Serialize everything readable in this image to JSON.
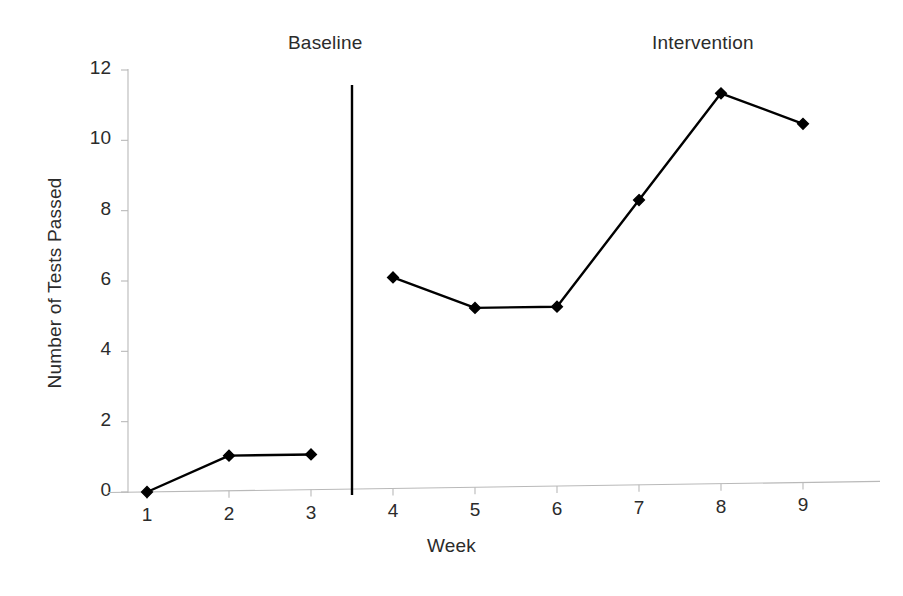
{
  "chart_data": {
    "type": "line",
    "title": "",
    "subtitle": "",
    "xlabel": "Week",
    "ylabel": "Number of Tests Passed",
    "x": [
      1,
      2,
      3,
      4,
      5,
      6,
      7,
      8,
      9
    ],
    "categories": [
      "1",
      "2",
      "3",
      "4",
      "5",
      "6",
      "7",
      "8",
      "9"
    ],
    "values": [
      0,
      1,
      1,
      6,
      5.1,
      5.1,
      8.1,
      11.1,
      10.2
    ],
    "series": [
      {
        "name": "Number of Tests Passed",
        "values": [
          0,
          1,
          1,
          6,
          5.1,
          5.1,
          8.1,
          11.1,
          10.2
        ],
        "marker": "diamond",
        "color": "#000000"
      }
    ],
    "xlim": [
      0.5,
      9.5
    ],
    "ylim": [
      0,
      12
    ],
    "ytick_labels": [
      "0",
      "2",
      "4",
      "6",
      "8",
      "10",
      "12"
    ],
    "ytick_values": [
      0,
      2,
      4,
      6,
      8,
      10,
      12
    ],
    "xtick_labels": [
      "1",
      "2",
      "3",
      "4",
      "5",
      "6",
      "7",
      "8",
      "9"
    ],
    "grid": false,
    "legend": "none",
    "annotations": [
      {
        "name": "phase-label-baseline",
        "text": "Baseline",
        "x_value": 2.4,
        "position": "top"
      },
      {
        "name": "phase-label-intervention",
        "text": "Intervention",
        "x_value": 7.0,
        "position": "top"
      },
      {
        "name": "phase-change-line",
        "text": "",
        "x_value": 3.5,
        "position": "vertical-divider"
      }
    ],
    "phases": [
      {
        "label": "Baseline",
        "weeks": [
          1,
          2,
          3
        ]
      },
      {
        "label": "Intervention",
        "weeks": [
          4,
          5,
          6,
          7,
          8,
          9
        ]
      }
    ],
    "colors": {
      "series_line": "#000000",
      "marker": "#000000",
      "axis": "#b9b9b9",
      "phase_divider": "#000000",
      "background": "#ffffff",
      "text": "#2b2b2b"
    }
  }
}
